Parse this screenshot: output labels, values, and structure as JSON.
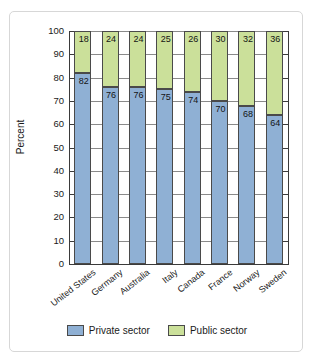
{
  "chart_data": {
    "type": "bar",
    "subtype": "stacked-bar",
    "title": "",
    "xlabel": "",
    "ylabel": "Percent",
    "ylim": [
      0,
      100
    ],
    "yticks": [
      0,
      10,
      20,
      30,
      40,
      50,
      60,
      70,
      80,
      90,
      100
    ],
    "ytick_labels": [
      "0",
      "10",
      "20",
      "30",
      "40",
      "50",
      "60",
      "70",
      "80",
      "90",
      "100"
    ],
    "grid": true,
    "legend_position": "bottom-center",
    "categories": [
      "United States",
      "Germany",
      "Australia",
      "Italy",
      "Canada",
      "France",
      "Norway",
      "Sweden"
    ],
    "series": [
      {
        "name": "Private sector",
        "color": "#8fb0d4",
        "values": [
          82,
          76,
          76,
          75,
          74,
          70,
          68,
          64
        ]
      },
      {
        "name": "Public sector",
        "color": "#cbe09a",
        "values": [
          18,
          24,
          24,
          25,
          26,
          30,
          32,
          36
        ]
      }
    ],
    "data_labels": {
      "private": [
        "82",
        "76",
        "76",
        "75",
        "74",
        "70",
        "68",
        "64"
      ],
      "public": [
        "18",
        "24",
        "24",
        "25",
        "26",
        "30",
        "32",
        "36"
      ]
    }
  },
  "legend": {
    "items": [
      {
        "label": "Private sector",
        "color": "#8fb0d4"
      },
      {
        "label": "Public sector",
        "color": "#cbe09a"
      }
    ]
  },
  "colors": {
    "private": "#8fb0d4",
    "public": "#cbe09a",
    "axis": "#3a3a3a",
    "grid": "#8a8a8a",
    "frame": "#d7d7d7",
    "background": "#ffffff"
  }
}
